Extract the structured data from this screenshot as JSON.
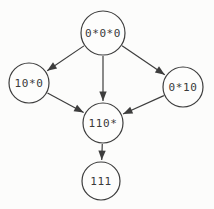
{
  "diagram": {
    "type": "directed-graph",
    "background_color": "#fcfcfb",
    "stroke_color": "#3d3d3d",
    "text_color": "#3a3a3a",
    "nodes": [
      {
        "id": "n0",
        "label": "0*0*0",
        "x": 103,
        "y": 33,
        "r": 22
      },
      {
        "id": "n1",
        "label": "10*0",
        "x": 29,
        "y": 83,
        "r": 20
      },
      {
        "id": "n2",
        "label": "0*10",
        "x": 183,
        "y": 87,
        "r": 20
      },
      {
        "id": "n3",
        "label": "110*",
        "x": 103,
        "y": 123,
        "r": 20
      },
      {
        "id": "n4",
        "label": "111",
        "x": 101,
        "y": 181,
        "r": 19
      }
    ],
    "edges": [
      {
        "from": "n0",
        "to": "n1"
      },
      {
        "from": "n0",
        "to": "n3"
      },
      {
        "from": "n0",
        "to": "n2"
      },
      {
        "from": "n1",
        "to": "n3"
      },
      {
        "from": "n2",
        "to": "n3"
      },
      {
        "from": "n3",
        "to": "n4"
      }
    ]
  }
}
